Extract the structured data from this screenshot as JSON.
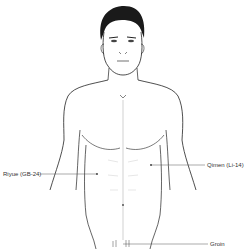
{
  "diagram": {
    "line_color": "#222222",
    "guide_color": "#555555",
    "labels": [
      {
        "id": "riyue",
        "text": "Riyue (GB-24)"
      },
      {
        "id": "qimen",
        "text": "Qimen (Li-14)"
      },
      {
        "id": "groin",
        "text": "Groin"
      }
    ]
  }
}
